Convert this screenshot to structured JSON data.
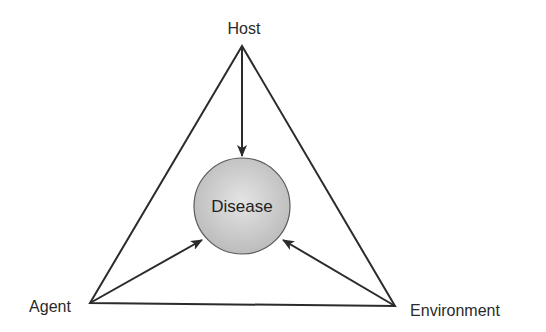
{
  "diagram": {
    "type": "epidemiologic-triangle",
    "nodes": {
      "host": {
        "label": "Host",
        "x": 242,
        "y": 46
      },
      "agent": {
        "label": "Agent",
        "x": 90,
        "y": 303
      },
      "environment": {
        "label": "Environment",
        "x": 395,
        "y": 306
      }
    },
    "center": {
      "label": "Disease",
      "cx": 242,
      "cy": 206,
      "r": 48
    },
    "edges": [
      {
        "from": "host",
        "to": "agent",
        "kind": "triangle-side"
      },
      {
        "from": "agent",
        "to": "environment",
        "kind": "triangle-side"
      },
      {
        "from": "environment",
        "to": "host",
        "kind": "triangle-side"
      },
      {
        "from": "host",
        "to": "disease",
        "kind": "arrow"
      },
      {
        "from": "agent",
        "to": "disease",
        "kind": "arrow"
      },
      {
        "from": "environment",
        "to": "disease",
        "kind": "arrow"
      }
    ],
    "colors": {
      "line": "#2b2b2b",
      "circle_fill_center": "#e2e2e2",
      "circle_fill_edge": "#b8b8b8",
      "circle_stroke": "#555555"
    }
  }
}
